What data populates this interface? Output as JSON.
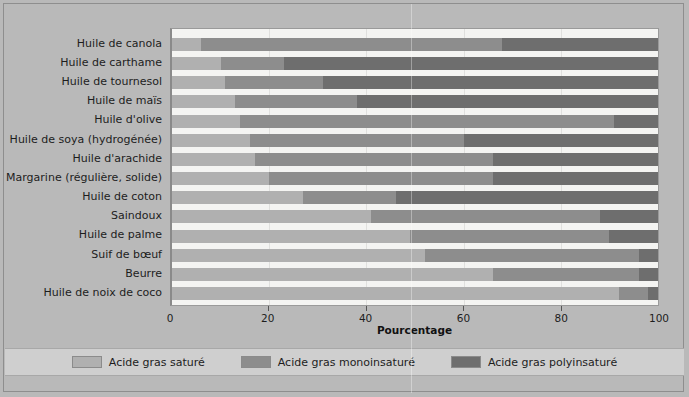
{
  "chart_data": {
    "type": "bar",
    "orientation": "horizontal",
    "stacked": true,
    "title": "",
    "subtitle": "",
    "xlabel": "Pourcentage",
    "ylabel": "",
    "xlim": [
      0,
      100
    ],
    "xticks": [
      0,
      20,
      40,
      60,
      80,
      100
    ],
    "grid": true,
    "legend_position": "bottom",
    "categories": [
      "Huile de canola",
      "Huile de carthame",
      "Huile de tournesol",
      "Huile de maïs",
      "Huile d'olive",
      "Huile de soya (hydrogénée)",
      "Huile d'arachide",
      "Margarine (régulière, solide)",
      "Huile de coton",
      "Saindoux",
      "Huile de palme",
      "Suif de bœuf",
      "Beurre",
      "Huile de noix de coco"
    ],
    "series": [
      {
        "name": "Acide gras saturé",
        "color": "#b0b0b0",
        "values": [
          6,
          10,
          11,
          13,
          14,
          16,
          17,
          20,
          27,
          41,
          49,
          52,
          66,
          92
        ]
      },
      {
        "name": "Acide gras monoinsaturé",
        "color": "#8d8d8d",
        "values": [
          62,
          13,
          20,
          25,
          77,
          44,
          49,
          46,
          19,
          47,
          41,
          44,
          30,
          6
        ]
      },
      {
        "name": "Acide gras polyinsaturé",
        "color": "#6e6e6e",
        "values": [
          32,
          77,
          69,
          62,
          9,
          40,
          34,
          34,
          54,
          12,
          10,
          4,
          4,
          2
        ]
      }
    ]
  },
  "axis": {
    "x_title": "Pourcentage",
    "tick_labels": [
      "0",
      "20",
      "40",
      "60",
      "80",
      "100"
    ]
  },
  "legend": {
    "items": [
      {
        "label": "Acide gras saturé",
        "swatch": "sat"
      },
      {
        "label": "Acide gras monoinsaturé",
        "swatch": "mono"
      },
      {
        "label": "Acide gras polyinsaturé",
        "swatch": "poly"
      }
    ]
  },
  "colors": {
    "saturated": "#b0b0b0",
    "monounsaturated": "#8d8d8d",
    "polyunsaturated": "#6e6e6e",
    "background": "#b9b9b9",
    "plot_background": "#f4f4f2",
    "legend_background": "#cfcfcf"
  }
}
